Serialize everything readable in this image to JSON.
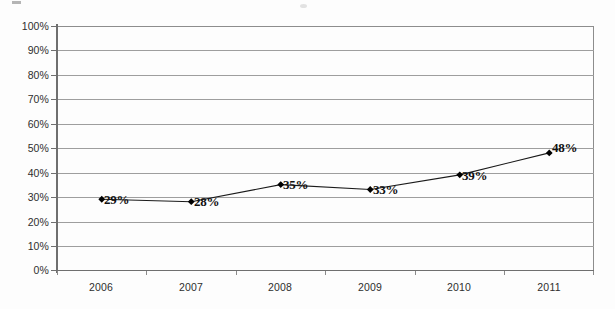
{
  "chart_data": {
    "type": "line",
    "title": "",
    "subtitle": "",
    "xlabel": "",
    "ylabel": "",
    "categories": [
      "2006",
      "2007",
      "2008",
      "2009",
      "2010",
      "2011"
    ],
    "values": [
      29,
      28,
      35,
      33,
      39,
      48
    ],
    "data_labels": [
      "29%",
      "28%",
      "35%",
      "33%",
      "39%",
      "48%"
    ],
    "ylim": [
      0,
      100
    ],
    "ytick_labels": [
      "100%",
      "90%",
      "80%",
      "70%",
      "60%",
      "50%",
      "40%",
      "30%",
      "20%",
      "10%",
      "0%"
    ],
    "ytick_values": [
      100,
      90,
      80,
      70,
      60,
      50,
      40,
      30,
      20,
      10,
      0
    ],
    "grid": true,
    "legend": "none",
    "marker": "diamond",
    "series": [
      {
        "name": "",
        "values": [
          29,
          28,
          35,
          33,
          39,
          48
        ]
      }
    ],
    "colors": {
      "line": "#1a1a1a",
      "marker": "#000000",
      "gridline": "#9e9e9e",
      "axis": "#6f6f6f",
      "label_text": "#2e2e2e",
      "data_label_text": "#111111",
      "background": "#fdfdfd"
    }
  }
}
